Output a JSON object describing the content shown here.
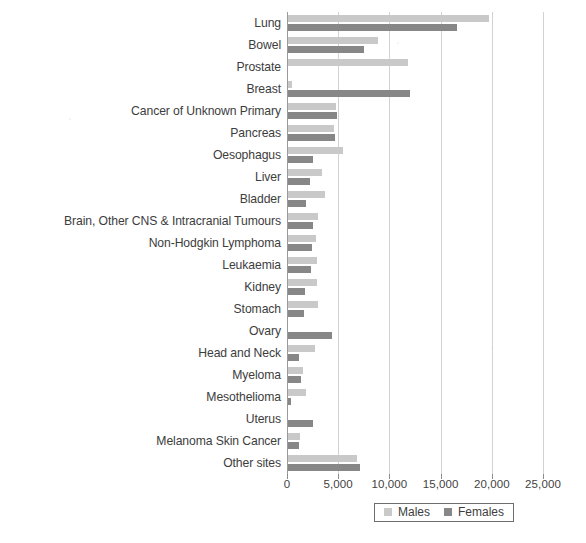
{
  "chart_data": {
    "type": "bar",
    "orientation": "horizontal",
    "title": "",
    "subtitle": "",
    "xlabel": "",
    "ylabel": "",
    "xlim": [
      0,
      25000
    ],
    "xticks": [
      0,
      5000,
      10000,
      15000,
      20000,
      25000
    ],
    "xtick_labels": [
      "0",
      "5,000",
      "10,000",
      "15,000",
      "20,000",
      "25,000"
    ],
    "grid": true,
    "legend_position": "bottom",
    "categories": [
      "Lung",
      "Bowel",
      "Prostate",
      "Breast",
      "Cancer of Unknown Primary",
      "Pancreas",
      "Oesophagus",
      "Liver",
      "Bladder",
      "Brain, Other CNS & Intracranial Tumours",
      "Non-Hodgkin Lymphoma",
      "Leukaemia",
      "Kidney",
      "Stomach",
      "Ovary",
      "Head and Neck",
      "Myeloma",
      "Mesothelioma",
      "Uterus",
      "Melanoma Skin Cancer",
      "Other sites"
    ],
    "series": [
      {
        "name": "Males",
        "color": "#c9c9c9",
        "values": [
          19600,
          8800,
          11700,
          350,
          4700,
          4500,
          5400,
          3300,
          3600,
          2900,
          2700,
          2800,
          2800,
          2900,
          0,
          2600,
          1500,
          1800,
          0,
          1200,
          6700
        ]
      },
      {
        "name": "Females",
        "color": "#878787",
        "values": [
          16500,
          7400,
          0,
          11900,
          4800,
          4600,
          2400,
          2100,
          1800,
          2400,
          2300,
          2200,
          1700,
          1600,
          4300,
          1100,
          1300,
          300,
          2400,
          1100,
          7000
        ]
      }
    ],
    "legend": [
      {
        "label": "Males",
        "color": "#c9c9c9"
      },
      {
        "label": "Females",
        "color": "#878787"
      }
    ]
  }
}
